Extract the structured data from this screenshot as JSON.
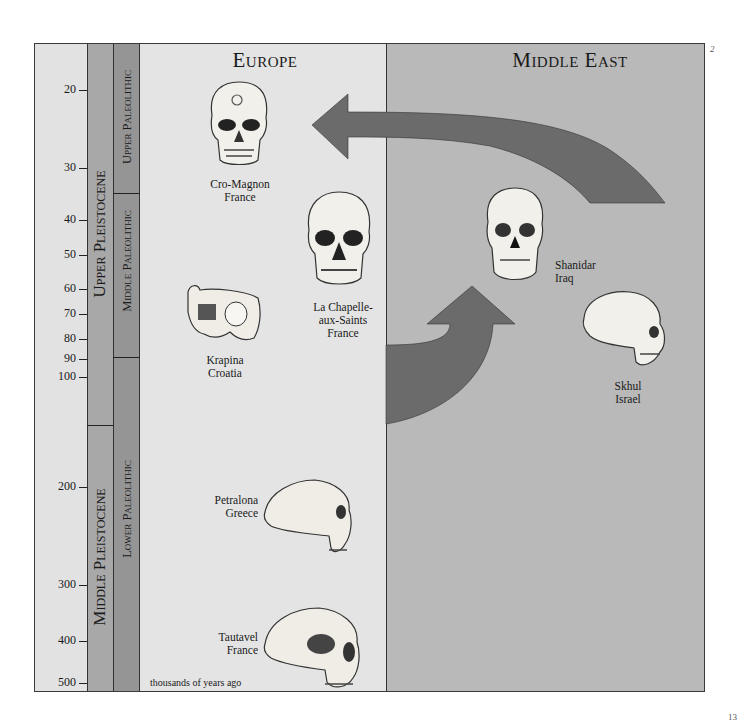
{
  "regions": {
    "europe": {
      "title": "Europe"
    },
    "middle_east": {
      "title": "Middle East"
    }
  },
  "time_scale": {
    "units_label": "thousands of years ago",
    "ticks": [
      {
        "label": "20",
        "y": 89
      },
      {
        "label": "30",
        "y": 167
      },
      {
        "label": "40",
        "y": 219
      },
      {
        "label": "50",
        "y": 254
      },
      {
        "label": "60",
        "y": 288
      },
      {
        "label": "70",
        "y": 313
      },
      {
        "label": "80",
        "y": 338
      },
      {
        "label": "90",
        "y": 358
      },
      {
        "label": "100",
        "y": 376
      },
      {
        "label": "200",
        "y": 486
      },
      {
        "label": "300",
        "y": 584
      },
      {
        "label": "400",
        "y": 640
      },
      {
        "label": "500",
        "y": 682
      }
    ]
  },
  "epochs": [
    {
      "label": "Upper Pleistocene",
      "y_start": 43,
      "y_end": 425
    },
    {
      "label": "Middle Pleistocene",
      "y_start": 425,
      "y_end": 692
    }
  ],
  "periods": [
    {
      "label": "Upper Paleolithic",
      "y_start": 43,
      "y_end": 193
    },
    {
      "label": "Middle Paleolithic",
      "y_start": 193,
      "y_end": 357
    },
    {
      "label": "Lower Paleolithic",
      "y_start": 357,
      "y_end": 692
    }
  ],
  "specimens": [
    {
      "name": "Cro-Magnon",
      "location": "France",
      "region": "europe"
    },
    {
      "name": "La Chapelle-",
      "name2": "aux-Saints",
      "location": "France",
      "region": "europe"
    },
    {
      "name": "Krapina",
      "location": "Croatia",
      "region": "europe"
    },
    {
      "name": "Petralona",
      "location": "Greece",
      "region": "europe"
    },
    {
      "name": "Tautavel",
      "location": "France",
      "region": "europe"
    },
    {
      "name": "Shanidar",
      "location": "Iraq",
      "region": "middle_east"
    },
    {
      "name": "Skhul",
      "location": "Israel",
      "region": "middle_east"
    }
  ],
  "arrows": [
    {
      "from": "middle_east",
      "to": "europe",
      "description": "migration arrow from Middle East to Europe (upper)"
    },
    {
      "from": "europe",
      "to": "middle_east",
      "description": "migration arrow from Europe to Middle East (lower)"
    }
  ],
  "page": {
    "corner_mark": "2",
    "page_number": "13"
  },
  "colors": {
    "scale_bg": "#e2e2e2",
    "epoch_bg": "#a8a8a8",
    "period_bg": "#959595",
    "europe_bg": "#e4e4e4",
    "middle_east_bg": "#b9b9b9",
    "arrow": "#6b6b6b"
  }
}
